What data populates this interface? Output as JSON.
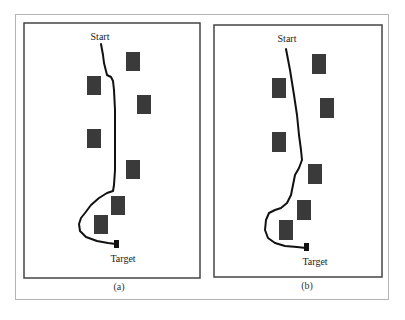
{
  "figure": {
    "panels": [
      {
        "id": "a",
        "caption": "(a)",
        "start_label": "Start",
        "target_label": "Target",
        "frame": {
          "x": 24,
          "y": 23,
          "w": 176,
          "h": 255
        },
        "obstacles": [
          {
            "x": 126,
            "y": 52,
            "w": 14,
            "h": 19
          },
          {
            "x": 87,
            "y": 76,
            "w": 14,
            "h": 19
          },
          {
            "x": 137,
            "y": 95,
            "w": 14,
            "h": 19
          },
          {
            "x": 87,
            "y": 129,
            "w": 14,
            "h": 19
          },
          {
            "x": 126,
            "y": 160,
            "w": 14,
            "h": 19
          },
          {
            "x": 111,
            "y": 196,
            "w": 14,
            "h": 19
          },
          {
            "x": 94,
            "y": 215,
            "w": 14,
            "h": 19
          }
        ],
        "target_marker": {
          "x": 114,
          "y": 240,
          "w": 5,
          "h": 8
        },
        "path": "M101,44 L103,55 L104,63 L106,71 L107,75 L111,77 L113,81 L114,90 L115,110 L115,140 L115,170 L114,185 L113,191 L107,193 L99,198 L91,205 L85,213 L81,218 L79,224 L80,231 L86,237 L97,241 L108,243 L116,244",
        "start_label_pos": {
          "x": 100,
          "y": 40
        },
        "target_label_pos": {
          "x": 123,
          "y": 262
        },
        "caption_pos": {
          "x": 119,
          "y": 290
        }
      },
      {
        "id": "b",
        "caption": "(b)",
        "start_label": "Start",
        "target_label": "Target",
        "frame": {
          "x": 214,
          "y": 25,
          "w": 168,
          "h": 252
        },
        "obstacles": [
          {
            "x": 312,
            "y": 54,
            "w": 14,
            "h": 20
          },
          {
            "x": 272,
            "y": 78,
            "w": 14,
            "h": 20
          },
          {
            "x": 320,
            "y": 98,
            "w": 14,
            "h": 20
          },
          {
            "x": 272,
            "y": 132,
            "w": 14,
            "h": 20
          },
          {
            "x": 308,
            "y": 164,
            "w": 14,
            "h": 20
          },
          {
            "x": 297,
            "y": 200,
            "w": 14,
            "h": 20
          },
          {
            "x": 279,
            "y": 220,
            "w": 14,
            "h": 20
          }
        ],
        "target_marker": {
          "x": 304,
          "y": 243,
          "w": 5,
          "h": 8
        },
        "path": "M286,49 L290,70 L294,95 L297,115 L299,135 L301,150 L302,160 L299,168 L295,175 L293,185 L291,195 L287,203 L281,208 L275,210 L269,213 L266,220 L265,230 L268,238 L275,243 L285,246 L297,247 L306,248",
        "start_label_pos": {
          "x": 287,
          "y": 42
        },
        "target_label_pos": {
          "x": 315,
          "y": 265
        },
        "caption_pos": {
          "x": 307,
          "y": 289
        }
      }
    ],
    "colors": {
      "obstacle": "#3a3a3a",
      "path": "#111111",
      "panel_border": "#444444",
      "outer_border": "#b4b4b4"
    }
  }
}
